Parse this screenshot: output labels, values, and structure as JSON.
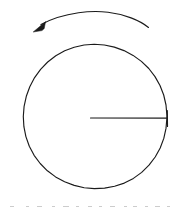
{
  "figure": {
    "background_color": "#ffffff",
    "stroke_color": "#1b1b1b",
    "width": 183,
    "height": 210,
    "caption_fragment_text": ""
  },
  "disk": {
    "label": "disk-circle",
    "center_x": 90.5,
    "center_y": 118,
    "radius": 78,
    "stroke_color": "#1b1b1b",
    "stroke_width": 1.15,
    "fill": "none"
  },
  "radius_line": {
    "label": "radius-line",
    "from_x": 90.5,
    "from_y": 118,
    "to_x": 168,
    "to_y": 118,
    "stroke_color": "#1b1b1b"
  },
  "rotation_arrow": {
    "label": "rotation-arrow",
    "direction": "counterclockwise",
    "arc_start_x": 148,
    "arc_start_y": 27,
    "arc_apex_x": 90,
    "arc_apex_y": 12,
    "arc_end_x": 40,
    "arc_end_y": 25,
    "head_tip_x": 33,
    "head_tip_y": 32,
    "stroke_color": "#1b1b1b"
  },
  "caption_fragments": {
    "label": "cut-off-caption-fragments",
    "top": 203,
    "marks": [
      {
        "x": 10,
        "w": 4
      },
      {
        "x": 26,
        "w": 3
      },
      {
        "x": 37,
        "w": 5
      },
      {
        "x": 52,
        "w": 3
      },
      {
        "x": 63,
        "w": 6
      },
      {
        "x": 76,
        "w": 3
      },
      {
        "x": 88,
        "w": 4
      },
      {
        "x": 99,
        "w": 3
      },
      {
        "x": 110,
        "w": 5
      },
      {
        "x": 124,
        "w": 3
      },
      {
        "x": 133,
        "w": 4
      },
      {
        "x": 145,
        "w": 3
      },
      {
        "x": 155,
        "w": 5
      },
      {
        "x": 167,
        "w": 3
      }
    ]
  }
}
